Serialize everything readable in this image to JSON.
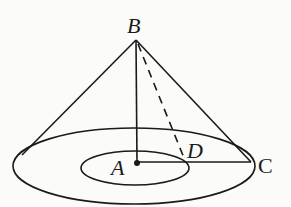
{
  "diagram": {
    "type": "geometry-cone",
    "labels": {
      "apex": "B",
      "center": "A",
      "rim_point": "C",
      "inner_point": "D"
    },
    "elements": [
      "cone with apex B",
      "outer base ellipse centered at A",
      "inner concentric ellipse",
      "segment BA (height)",
      "segment AC (radius)",
      "dashed segment BD",
      "point A marked with dot"
    ],
    "colors": {
      "stroke": "#1a1a1a",
      "background": "#fbfbfa"
    }
  }
}
